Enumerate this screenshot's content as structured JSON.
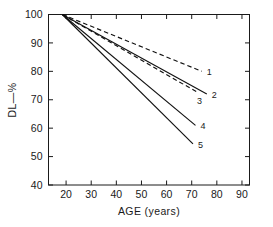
{
  "chart_data": {
    "type": "line",
    "title": "",
    "xlabel": "AGE (years)",
    "ylabel": "DL—%",
    "xlim": [
      13,
      93
    ],
    "ylim": [
      40,
      100
    ],
    "xticks": [
      20,
      30,
      40,
      50,
      60,
      70,
      80,
      90
    ],
    "xtick_labels": [
      "20",
      "30",
      "40",
      "50",
      "60",
      "70",
      "80",
      "90"
    ],
    "yticks": [
      40,
      50,
      60,
      70,
      80,
      90,
      100
    ],
    "ytick_labels": [
      "40",
      "50",
      "60",
      "70",
      "80",
      "90",
      "100"
    ],
    "grid": false,
    "legend_position": "line-end-labels",
    "origin_point": [
      18.5,
      100
    ],
    "series": [
      {
        "name": "1",
        "label": "1",
        "style": "dashed",
        "x": [
          18.5,
          74.0
        ],
        "y": [
          100.0,
          80.0
        ]
      },
      {
        "name": "2",
        "label": "2",
        "style": "solid",
        "x": [
          18.5,
          76.0
        ],
        "y": [
          100.0,
          72.0
        ]
      },
      {
        "name": "3",
        "label": "3",
        "style": "dashed",
        "x": [
          18.5,
          72.5
        ],
        "y": [
          100.0,
          72.5
        ]
      },
      {
        "name": "4",
        "label": "4",
        "style": "solid",
        "x": [
          18.5,
          71.5
        ],
        "y": [
          100.0,
          61.0
        ]
      },
      {
        "name": "5",
        "label": "5",
        "style": "solid",
        "x": [
          18.5,
          70.5
        ],
        "y": [
          100.0,
          54.5
        ]
      }
    ],
    "colors": {
      "axis": "#1a1a1a",
      "curve": "#111111",
      "background": "#ffffff"
    }
  }
}
